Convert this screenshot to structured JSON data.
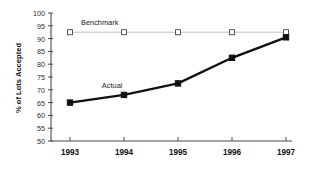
{
  "chart_data": {
    "type": "line",
    "title": "",
    "subtitle": "",
    "xlabel": "",
    "ylabel": "% of Lots Accepted",
    "categories": [
      "1993",
      "1994",
      "1995",
      "1996",
      "1997"
    ],
    "x": [
      1993,
      1994,
      1995,
      1996,
      1997
    ],
    "ylim": [
      50,
      100
    ],
    "yticks": [
      50,
      55,
      60,
      65,
      70,
      75,
      80,
      85,
      90,
      95,
      100
    ],
    "ytick_labels": [
      "50",
      "55",
      "60",
      "65",
      "70",
      "75",
      "80",
      "85",
      "90",
      "95",
      "100"
    ],
    "grid": false,
    "legend_position": "inline-annotation",
    "series": [
      {
        "name": "Benchmark",
        "values": [
          92.5,
          92.5,
          92.5,
          92.5,
          92.5
        ],
        "marker": "open-square",
        "line_color": "#b9b9b9",
        "marker_color": "#ffffff",
        "marker_edge_color": "#555555",
        "annotation": "Benchmark",
        "annotation_x": 1993.55,
        "annotation_y": 95.4
      },
      {
        "name": "Actual",
        "values": [
          65.0,
          68.0,
          72.5,
          82.5,
          90.5
        ],
        "marker": "filled-square",
        "line_color": "#101010",
        "marker_color": "#101010",
        "marker_edge_color": "#101010",
        "annotation": "Actual",
        "annotation_x": 1993.78,
        "annotation_y": 70.8
      }
    ]
  },
  "axes": {
    "y_axis_title": "% of Lots Accepted",
    "y_tick_values": [
      "100",
      "95",
      "90",
      "85",
      "80",
      "75",
      "70",
      "65",
      "60",
      "55",
      "50"
    ],
    "x_tick_values": [
      "1993",
      "1994",
      "1995",
      "1996",
      "1997"
    ]
  },
  "annotations": {
    "benchmark_label": "Benchmark",
    "actual_label": "Actual"
  },
  "colors": {
    "background": "#ffffff",
    "axis": "#4a4a4a",
    "actual_series": "#101010",
    "benchmark_series": "#b9b9b9",
    "text": "#111111"
  }
}
